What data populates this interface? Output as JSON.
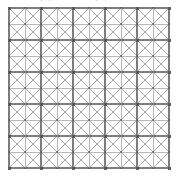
{
  "figure": {
    "title_fragment": "Fig. Typical cross-braced grid panel with nodes",
    "background_color": "#ffffff"
  },
  "chart_data": {
    "type": "diagram",
    "title": "",
    "subtitle": "",
    "xlabel": "",
    "ylabel": "",
    "structure": "square-grid-with-full-x-bracing",
    "columns": 10,
    "rows": 10,
    "cell_size_px": 16,
    "origin_x_px": 9,
    "origin_y_px": 8,
    "grid_width_px": 160,
    "grid_height_px": 160,
    "node_count": 121,
    "horizontal_member_count": 110,
    "vertical_member_count": 110,
    "diagonal_member_count": 200,
    "grid_line_color": "#b4b4b4",
    "grid_line_width": 0.9,
    "emphasis_line_color": "#7d7d7d",
    "emphasis_line_width": 1.2,
    "diagonal_color": "#8c8c8c",
    "diagonal_width": 0.75,
    "node_color": "#5a5a5a",
    "node_size_px": 2.1,
    "emphasized_rows": [
      0,
      2,
      4,
      6,
      8,
      10
    ],
    "emphasized_columns": [
      0,
      2,
      4,
      6,
      8,
      10
    ],
    "legend": [],
    "annotations": [],
    "grid": true
  }
}
